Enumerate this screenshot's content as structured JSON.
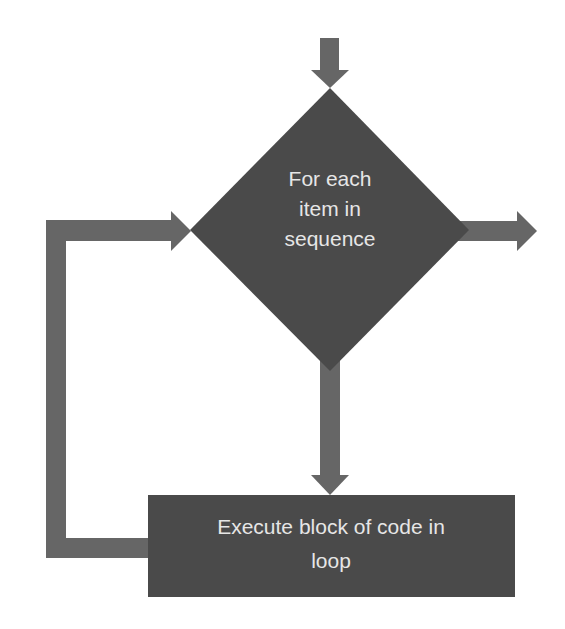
{
  "diagram": {
    "type": "flowchart",
    "title": "",
    "colors": {
      "background": "#ffffff",
      "shape_fill": "#4a4a4a",
      "arrow_fill": "#666666",
      "text": "#e6e6e6"
    },
    "nodes": [
      {
        "id": "decision",
        "shape": "diamond",
        "label_lines": [
          "For each",
          "item in",
          "sequence"
        ]
      },
      {
        "id": "process",
        "shape": "rectangle",
        "label_lines": [
          "Execute block of code in",
          "loop"
        ]
      }
    ],
    "edges": [
      {
        "from": "entry",
        "to": "decision",
        "direction": "down"
      },
      {
        "from": "decision",
        "to": "exit",
        "direction": "right"
      },
      {
        "from": "decision",
        "to": "process",
        "direction": "down"
      },
      {
        "from": "process",
        "to": "decision",
        "direction": "loop-back-left"
      }
    ]
  }
}
